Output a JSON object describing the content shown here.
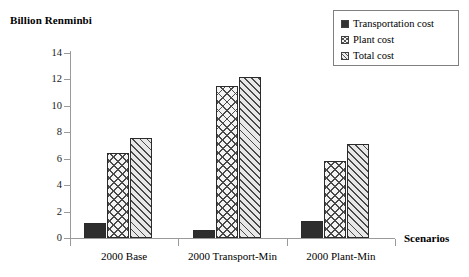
{
  "chart_data": {
    "type": "bar",
    "title": "",
    "ylabel": "Billion Renminbi",
    "xlabel": "Scenarios",
    "ylim": [
      0,
      14
    ],
    "yticks": [
      0,
      2,
      4,
      6,
      8,
      10,
      12,
      14
    ],
    "grid": false,
    "legend_position": "top-right",
    "categories": [
      "2000 Base",
      "2000 Transport-Min",
      "2000 Plant-Min"
    ],
    "series": [
      {
        "name": "Transportation cost",
        "pattern": "solid",
        "values": [
          1.1,
          0.6,
          1.3
        ]
      },
      {
        "name": "Plant cost",
        "pattern": "crosshatch",
        "values": [
          6.4,
          11.5,
          5.8
        ]
      },
      {
        "name": "Total cost",
        "pattern": "diagonal",
        "values": [
          7.6,
          12.2,
          7.1
        ]
      }
    ]
  },
  "legend": {
    "items": [
      {
        "label": "Transportation cost"
      },
      {
        "label": "Plant cost"
      },
      {
        "label": "Total cost"
      }
    ]
  },
  "axes": {
    "y_title": "Billion Renminbi",
    "x_title": "Scenarios",
    "y_tick_labels": [
      "14",
      "12",
      "10",
      "8",
      "6",
      "4",
      "2",
      "0"
    ],
    "x_tick_labels": [
      "2000 Base",
      "2000 Transport-Min",
      "2000 Plant-Min"
    ]
  },
  "colors": {
    "axis": "#9a9a9a",
    "text": "#000000",
    "bar_outline": "#2b2b2b",
    "solid_fill": "#2e2e2e",
    "legend_border": "#808080"
  }
}
